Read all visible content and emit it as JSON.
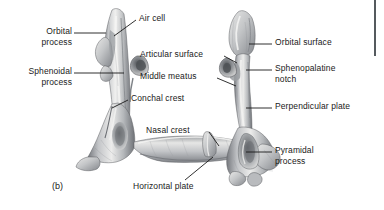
{
  "figure": {
    "caption": "(b)",
    "caption_x": 52,
    "caption_y": 181,
    "background_color": "#ffffff",
    "text_color": "#1a1a1a",
    "leader_color": "#1a1a1a"
  },
  "scan_edge": {
    "x": 374,
    "y": 0,
    "width": 2,
    "height": 56,
    "color": "#555a5e"
  },
  "labels": [
    {
      "id": "orbital-process",
      "text": "Orbital\nprocess",
      "x": 14,
      "y": 26,
      "width": 58,
      "align": "right",
      "leader": [
        [
          74,
          33
        ],
        [
          106,
          33
        ]
      ]
    },
    {
      "id": "sphenoidal-process",
      "text": "Sphenoidal\nprocess",
      "x": 6,
      "y": 66,
      "width": 66,
      "align": "right",
      "leader": [
        [
          74,
          73
        ],
        [
          124,
          73
        ]
      ]
    },
    {
      "id": "air-cell",
      "text": "Air cell",
      "x": 139,
      "y": 13,
      "width": 42,
      "align": "left",
      "leader": [
        [
          136,
          20
        ],
        [
          114,
          36
        ]
      ]
    },
    {
      "id": "articular-surface",
      "text": "Articular surface",
      "x": 140,
      "y": 49,
      "width": 86,
      "align": "left",
      "leader": [
        [
          224,
          56
        ],
        [
          237,
          63
        ]
      ]
    },
    {
      "id": "middle-meatus",
      "text": "Middle meatus",
      "x": 140,
      "y": 71,
      "width": 78,
      "align": "left",
      "leader": [
        [
          217,
          78
        ],
        [
          236,
          86
        ]
      ]
    },
    {
      "id": "conchal-crest",
      "text": "Conchal crest",
      "x": 131,
      "y": 93,
      "width": 76,
      "align": "left",
      "leader": [
        [
          128,
          100
        ],
        [
          112,
          108
        ]
      ]
    },
    {
      "id": "nasal-crest",
      "text": "Nasal crest",
      "x": 146,
      "y": 125,
      "width": 64,
      "align": "left",
      "leader": [
        [
          209,
          132
        ],
        [
          219,
          146
        ]
      ]
    },
    {
      "id": "horizontal-plate",
      "text": "Horizontal plate",
      "x": 133,
      "y": 181,
      "width": 84,
      "align": "left",
      "leader": [
        [
          185,
          180
        ],
        [
          213,
          157
        ]
      ]
    },
    {
      "id": "orbital-surface",
      "text": "Orbital surface",
      "x": 275,
      "y": 37,
      "width": 80,
      "align": "left",
      "leader": [
        [
          272,
          44
        ],
        [
          249,
          44
        ]
      ]
    },
    {
      "id": "sphenopalatine-notch",
      "text": "Sphenopalatine\nnotch",
      "x": 275,
      "y": 63,
      "width": 86,
      "align": "left",
      "leader": [
        [
          272,
          70
        ],
        [
          246,
          70
        ]
      ]
    },
    {
      "id": "perpendicular-plate",
      "text": "Perpendicular plate",
      "x": 275,
      "y": 101,
      "width": 100,
      "align": "left",
      "leader": [
        [
          272,
          108
        ],
        [
          246,
          108
        ]
      ]
    },
    {
      "id": "pyramidal-process",
      "text": "Pyramidal\nprocess",
      "x": 275,
      "y": 145,
      "width": 62,
      "align": "left",
      "leader": [
        [
          272,
          152
        ],
        [
          246,
          152
        ]
      ]
    }
  ]
}
